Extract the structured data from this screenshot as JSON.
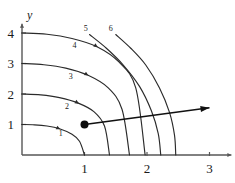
{
  "figure": {
    "title": "",
    "axes": {
      "x_name": "x",
      "y_name": "y",
      "x_ticks": [
        "1",
        "2",
        "3"
      ],
      "y_ticks": [
        "1",
        "2",
        "3",
        "4"
      ]
    },
    "curve_labels": [
      "1",
      "2",
      "3",
      "4",
      "5",
      "6"
    ],
    "colors": {
      "axis": "#575757",
      "curve": "#2b2b2b",
      "arrow": "#111111",
      "dot": "#0d0d0d",
      "text": "#1a1a1a",
      "background": "#ffffff"
    }
  },
  "chart_data": {
    "type": "line",
    "title": "",
    "subtitle": "",
    "xlabel": "x",
    "ylabel": "y",
    "xlim": [
      0,
      3.35
    ],
    "ylim": [
      0,
      4.3
    ],
    "x_ticks": [
      1,
      2,
      3
    ],
    "y_ticks": [
      1,
      2,
      3,
      4
    ],
    "grid": false,
    "legend": "none",
    "annotations": [
      {
        "name": "gradient-vector",
        "type": "arrow",
        "from": [
          1,
          1
        ],
        "to": [
          3,
          1.55
        ]
      },
      {
        "name": "evaluation-point",
        "type": "point",
        "at": [
          1,
          1
        ]
      }
    ],
    "series": [
      {
        "name": "1",
        "label": "1",
        "label_at": [
          0.62,
          0.62
        ],
        "y_intercept": 1,
        "x_intercept": 1,
        "points": [
          [
            0,
            1
          ],
          [
            0.2,
            0.99
          ],
          [
            0.4,
            0.95
          ],
          [
            0.6,
            0.86
          ],
          [
            0.8,
            0.68
          ],
          [
            0.92,
            0.45
          ],
          [
            1,
            0
          ]
        ]
      },
      {
        "name": "2",
        "label": "2",
        "label_at": [
          0.72,
          1.52
        ],
        "y_intercept": 2,
        "x_intercept": 1.4,
        "points": [
          [
            0,
            2
          ],
          [
            0.3,
            1.97
          ],
          [
            0.6,
            1.88
          ],
          [
            0.9,
            1.7
          ],
          [
            1.15,
            1.42
          ],
          [
            1.32,
            0.95
          ],
          [
            1.4,
            0
          ]
        ]
      },
      {
        "name": "3",
        "label": "3",
        "label_at": [
          0.78,
          2.5
        ],
        "y_intercept": 3,
        "x_intercept": 1.72,
        "points": [
          [
            0,
            3
          ],
          [
            0.35,
            2.96
          ],
          [
            0.7,
            2.85
          ],
          [
            1.05,
            2.62
          ],
          [
            1.38,
            2.2
          ],
          [
            1.6,
            1.5
          ],
          [
            1.72,
            0
          ]
        ]
      },
      {
        "name": "4",
        "label": "4",
        "label_at": [
          0.84,
          3.5
        ],
        "y_intercept": 4,
        "x_intercept": 1.97,
        "points": [
          [
            0,
            4
          ],
          [
            0.4,
            3.96
          ],
          [
            0.8,
            3.82
          ],
          [
            1.2,
            3.55
          ],
          [
            1.55,
            3.05
          ],
          [
            1.82,
            2.2
          ],
          [
            1.97,
            0
          ]
        ]
      },
      {
        "name": "5",
        "label": "5",
        "label_at": [
          1.02,
          4.08
        ],
        "y_intercept": null,
        "x_intercept": 2.22,
        "points": [
          [
            1.08,
            3.95
          ],
          [
            1.35,
            3.5
          ],
          [
            1.62,
            2.95
          ],
          [
            1.88,
            2.25
          ],
          [
            2.07,
            1.45
          ],
          [
            2.18,
            0.7
          ],
          [
            2.22,
            0
          ]
        ]
      },
      {
        "name": "6",
        "label": "6",
        "label_at": [
          1.42,
          4.08
        ],
        "y_intercept": null,
        "x_intercept": 2.46,
        "points": [
          [
            1.5,
            3.95
          ],
          [
            1.74,
            3.5
          ],
          [
            1.98,
            2.95
          ],
          [
            2.2,
            2.2
          ],
          [
            2.36,
            1.4
          ],
          [
            2.44,
            0.65
          ],
          [
            2.46,
            0
          ]
        ]
      }
    ]
  }
}
